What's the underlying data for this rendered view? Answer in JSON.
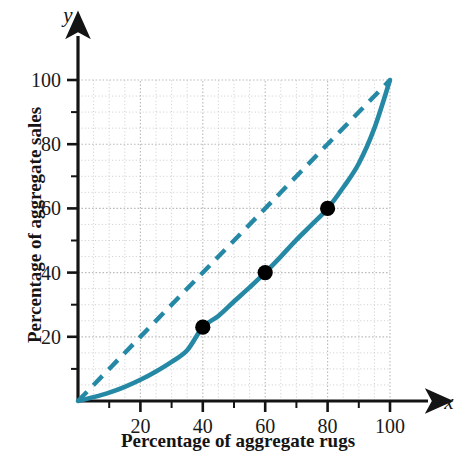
{
  "chart_data": {
    "type": "line",
    "title": "",
    "xlabel": "Percentage of aggregate rugs",
    "ylabel": "Percentage of aggregate sales",
    "xlim": [
      0,
      100
    ],
    "ylim": [
      0,
      100
    ],
    "grid": true,
    "grid_minor_step": 5,
    "grid_major_step": 20,
    "legend_position": "none",
    "x_axis_symbol": "x",
    "y_axis_symbol": "y",
    "xticks": [
      20,
      40,
      60,
      80,
      100
    ],
    "yticks": [
      20,
      40,
      60,
      80,
      100
    ],
    "xtick_labels": [
      "20",
      "40",
      "60",
      "80",
      "100"
    ],
    "ytick_labels": [
      "20",
      "40",
      "60",
      "80",
      "100"
    ],
    "xtick_minor_step": 10,
    "ytick_minor_step": 10,
    "accent_color": "#2589a6",
    "point_color": "#000000",
    "grid_color": "#b8b8b8",
    "axis_color": "#141414",
    "series": [
      {
        "name": "Lorenz curve",
        "style": "solid",
        "color": "#2589a6",
        "x": [
          0,
          5,
          10,
          15,
          20,
          25,
          30,
          35,
          40,
          45,
          50,
          55,
          60,
          65,
          70,
          75,
          80,
          85,
          90,
          95,
          100
        ],
        "y": [
          0,
          1.2,
          2.6,
          4.4,
          6.6,
          9.2,
          12.2,
          15.8,
          23.0,
          26.5,
          31.0,
          35.4,
          40.0,
          45.0,
          50.2,
          55.0,
          60.0,
          66.5,
          74.0,
          85.0,
          100.0
        ]
      },
      {
        "name": "Line of equality",
        "style": "dashed",
        "color": "#2589a6",
        "x": [
          0,
          100
        ],
        "y": [
          0,
          100
        ]
      }
    ],
    "points": [
      {
        "label": "point-40-23",
        "x": 40,
        "y": 23
      },
      {
        "label": "point-60-40",
        "x": 60,
        "y": 40
      },
      {
        "label": "point-80-60",
        "x": 80,
        "y": 60
      }
    ]
  }
}
